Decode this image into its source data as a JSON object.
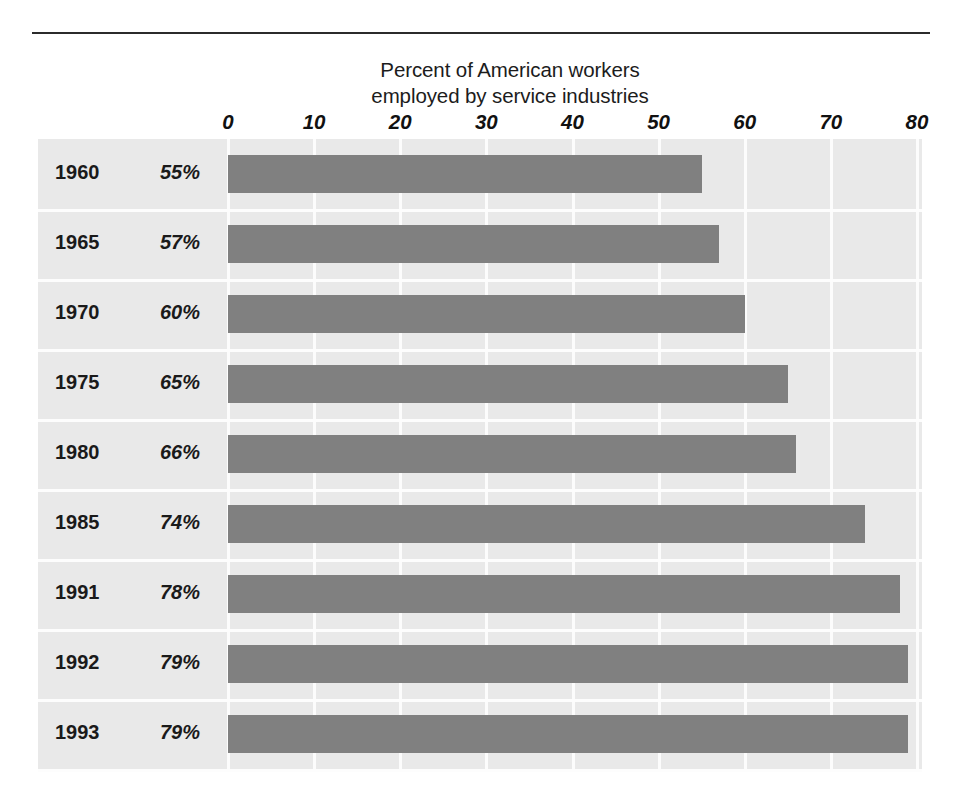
{
  "chart_data": {
    "type": "bar",
    "orientation": "horizontal",
    "title": "Percent of American workers employed by service industries",
    "title_lines": [
      "Percent of American workers",
      "employed by service industries"
    ],
    "xlabel": "",
    "ylabel": "",
    "categories": [
      "1960",
      "1965",
      "1970",
      "1975",
      "1980",
      "1985",
      "1991",
      "1992",
      "1993"
    ],
    "values": [
      55,
      57,
      60,
      65,
      66,
      74,
      78,
      79,
      79
    ],
    "value_labels": [
      "55%",
      "57%",
      "60%",
      "65%",
      "66%",
      "74%",
      "78%",
      "79%",
      "79%"
    ],
    "xlim": [
      0,
      80
    ],
    "xticks": [
      0,
      10,
      20,
      30,
      40,
      50,
      60,
      70,
      80
    ],
    "xtick_labels": [
      "0",
      "10",
      "20",
      "30",
      "40",
      "50",
      "60",
      "70",
      "80"
    ],
    "grid": true,
    "grid_orientation": "vertical",
    "legend": false,
    "bar_color": "#808080",
    "panel_color": "#e9e9e9",
    "gridline_color": "#fcfcfc",
    "rule_color": "#2b2b2b"
  },
  "rows": [
    {
      "year": "1960",
      "percent": "55%",
      "value": 55
    },
    {
      "year": "1965",
      "percent": "57%",
      "value": 57
    },
    {
      "year": "1970",
      "percent": "60%",
      "value": 60
    },
    {
      "year": "1975",
      "percent": "65%",
      "value": 65
    },
    {
      "year": "1980",
      "percent": "66%",
      "value": 66
    },
    {
      "year": "1985",
      "percent": "74%",
      "value": 74
    },
    {
      "year": "1991",
      "percent": "78%",
      "value": 78
    },
    {
      "year": "1992",
      "percent": "79%",
      "value": 79
    },
    {
      "year": "1993",
      "percent": "79%",
      "value": 79
    }
  ]
}
